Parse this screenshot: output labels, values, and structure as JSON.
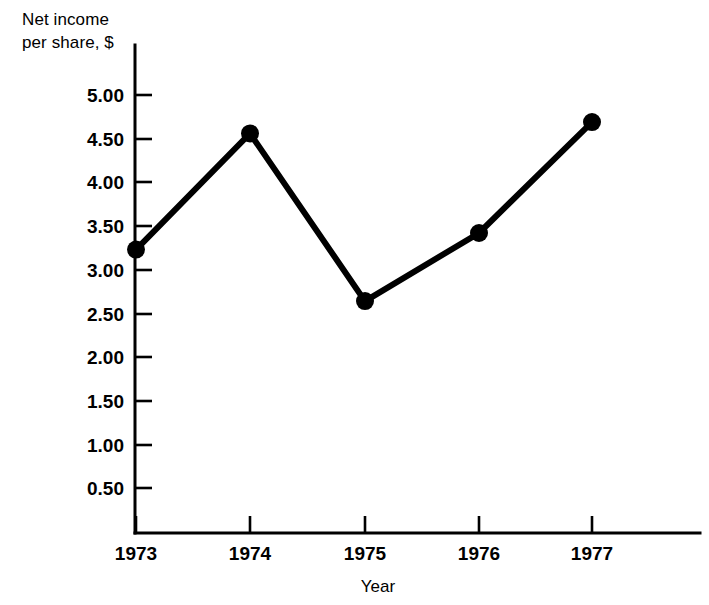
{
  "chart_data": {
    "type": "line",
    "title": "",
    "ylabel_line1": "Net income",
    "ylabel_line2": "per share, $",
    "xlabel": "Year",
    "categories": [
      "1973",
      "1974",
      "1975",
      "1976",
      "1977"
    ],
    "values": [
      3.23,
      4.56,
      2.64,
      3.42,
      4.69
    ],
    "series": [
      {
        "name": "Net income per share",
        "values": [
          3.23,
          4.56,
          2.64,
          3.42,
          4.69
        ]
      }
    ],
    "ytick_labels": [
      "5.00",
      "4.50",
      "4.00",
      "3.50",
      "3.00",
      "2.50",
      "2.00",
      "1.50",
      "1.00",
      "0.50"
    ],
    "ytick_values": [
      5.0,
      4.5,
      4.0,
      3.5,
      3.0,
      2.5,
      2.0,
      1.5,
      1.0,
      0.5
    ],
    "ylim": [
      0.0,
      5.45
    ],
    "xlim_categories": [
      "1973",
      "1977"
    ],
    "grid": false,
    "legend": false,
    "legend_position": "none",
    "marker": "filled-circle",
    "line_color": "#000000",
    "marker_color": "#000000",
    "background_color": "#ffffff"
  },
  "axes": {
    "y_axis_name": "y-axis",
    "x_axis_name": "x-axis"
  }
}
